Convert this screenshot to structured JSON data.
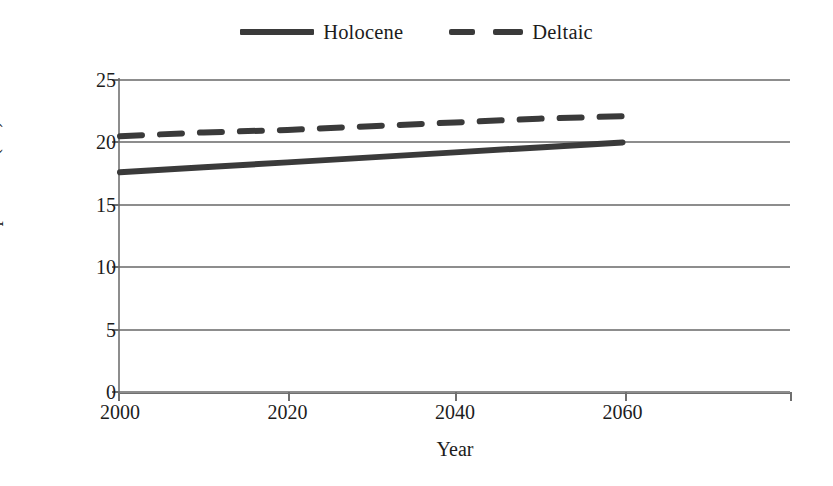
{
  "chart_data": {
    "type": "line",
    "title": "",
    "xlabel": "Year",
    "ylabel": "Mean annual temperature (°C)",
    "xlim": [
      2000,
      2080
    ],
    "ylim": [
      0,
      25
    ],
    "xticks": [
      2000,
      2020,
      2040,
      2060
    ],
    "yticks": [
      0,
      5,
      10,
      15,
      20,
      25
    ],
    "grid": "horizontal",
    "legend_position": "top-center",
    "x": [
      2000,
      2010,
      2020,
      2030,
      2040,
      2050,
      2060
    ],
    "series": [
      {
        "name": "Holocene",
        "style": "solid",
        "color": "#3a3a3a",
        "values": [
          17.6,
          18.0,
          18.4,
          18.8,
          19.2,
          19.6,
          20.0
        ]
      },
      {
        "name": "Deltaic",
        "style": "dashed",
        "color": "#3a3a3a",
        "values": [
          20.5,
          20.8,
          21.0,
          21.3,
          21.6,
          21.9,
          22.1
        ]
      }
    ]
  },
  "legend": {
    "entries": [
      {
        "label": "Holocene",
        "marker": "solid-line-swatch"
      },
      {
        "label": "Deltaic",
        "marker": "dashed-line-swatch"
      }
    ]
  },
  "axes": {
    "y": {
      "title": "Mean annual temperature (°C)",
      "tick_labels": [
        "25",
        "20",
        "15",
        "10",
        "5",
        "0"
      ]
    },
    "x": {
      "title": "Year",
      "tick_labels": [
        "2000",
        "2020",
        "2040",
        "2060"
      ]
    }
  }
}
